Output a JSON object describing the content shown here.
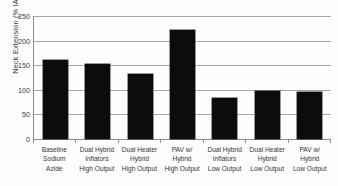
{
  "chart_data": {
    "type": "bar",
    "title": "",
    "xlabel": "",
    "ylabel": "Neck Extension (% IARV)",
    "ylim": [
      0,
      250
    ],
    "yticks": [
      0,
      50,
      100,
      150,
      200,
      250
    ],
    "grid": true,
    "legend": "none",
    "bar_color": "#0c0c0c",
    "categories": [
      "Baseline Sodium Azide",
      "Dual Hybrid Inflators High Output",
      "Dual Heater Hybrid High Output",
      "PAV w/ Hybrid High Output",
      "Dual Hybrid Inflators Low Output",
      "Dual Heater Hybrid Low Output",
      "PAV w/ Hybrid Low Output"
    ],
    "category_lines": [
      [
        "Baseline",
        "Sodium",
        "Azide"
      ],
      [
        "Dual Hybrid",
        "Inflators",
        "High Output"
      ],
      [
        "Dual Heater",
        "Hybrid",
        "High Output"
      ],
      [
        "PAV w/",
        "Hybrid",
        "High Output"
      ],
      [
        "Dual Hybrid",
        "Inflators",
        "Low Output"
      ],
      [
        "Dual Heater",
        "Hybrid",
        "Low Output"
      ],
      [
        "PAV w/",
        "Hybrid",
        "Low Output"
      ]
    ],
    "values": [
      160,
      153,
      132,
      221,
      83,
      98,
      96
    ]
  }
}
